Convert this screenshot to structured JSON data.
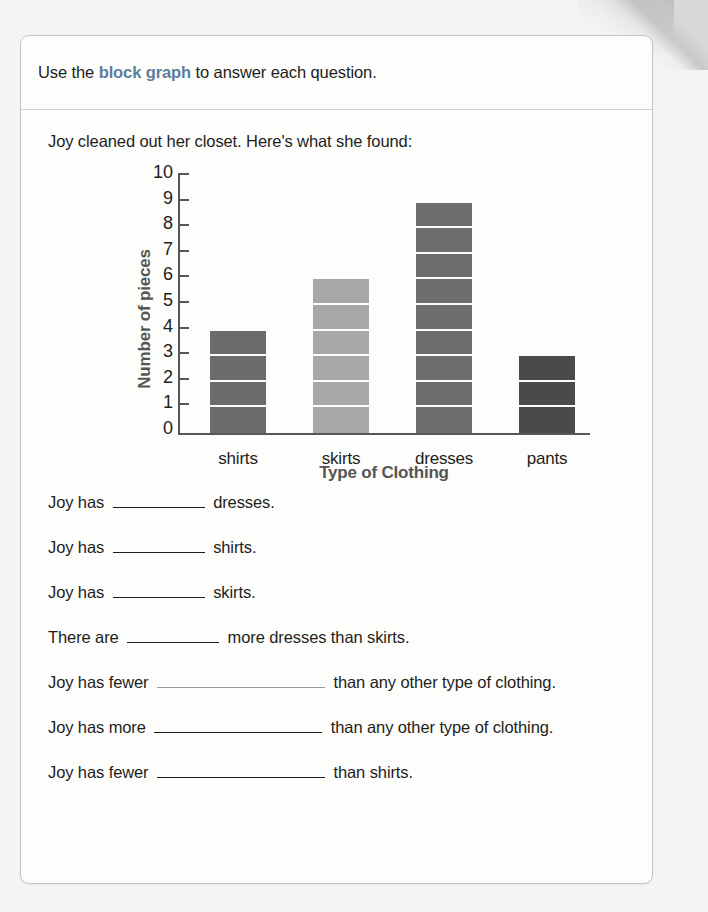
{
  "page": {
    "background_color": "#f4f4f2",
    "card_background": "#fdfdfc",
    "card_border_color": "#c4c4c2"
  },
  "header": {
    "directions_prefix": "Use the ",
    "directions_term": "block graph",
    "directions_suffix": " to answer each question.",
    "accent_color": "#5d7d9c"
  },
  "prompt": {
    "text": "Joy cleaned out her closet. Here's what she found:"
  },
  "chart_data": {
    "type": "bar",
    "title": "",
    "xlabel": "Type of Clothing",
    "ylabel": "Number of pieces",
    "categories": [
      "shirts",
      "skirts",
      "dresses",
      "pants"
    ],
    "values": [
      4,
      6,
      9,
      3
    ],
    "bar_colors": [
      "#6b6b6b",
      "#a8a8a8",
      "#6e6e6e",
      "#4a4a4a"
    ],
    "ylim": [
      0,
      10
    ],
    "y_ticks": [
      0,
      1,
      2,
      3,
      4,
      5,
      6,
      7,
      8,
      9,
      10
    ],
    "y_tick_labels": [
      "0",
      "1",
      "2",
      "3",
      "4",
      "5",
      "6",
      "7",
      "8",
      "9",
      "10"
    ],
    "grid": false,
    "legend": "none",
    "block_separator_color": "#fdfdfc",
    "axis_color": "#57575a",
    "note": "Block graph: each bar is divided into unit blocks of one piece each."
  },
  "questions": [
    {
      "id": "q1",
      "before": "Joy has",
      "blank": "short",
      "after": "dresses."
    },
    {
      "id": "q2",
      "before": "Joy has",
      "blank": "short",
      "after": "shirts."
    },
    {
      "id": "q3",
      "before": "Joy has",
      "blank": "short",
      "after": "skirts."
    },
    {
      "id": "q4",
      "before": "There are",
      "blank": "short",
      "after": "more dresses than skirts."
    },
    {
      "id": "q5",
      "before": "Joy has fewer",
      "blank": "long-faint",
      "after": "than any other type of clothing."
    },
    {
      "id": "q6",
      "before": "Joy has more",
      "blank": "long",
      "after": "than any other type of clothing."
    },
    {
      "id": "q7",
      "before": "Joy has fewer",
      "blank": "long",
      "after": "than shirts."
    }
  ]
}
